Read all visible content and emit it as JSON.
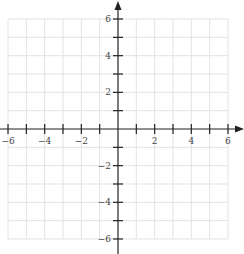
{
  "chart_data": {
    "type": "scatter",
    "title": "",
    "xlabel": "",
    "ylabel": "",
    "xlim": [
      -6,
      6
    ],
    "ylim": [
      -6,
      6
    ],
    "grid": true,
    "x_ticks": [
      -6,
      -5,
      -4,
      -3,
      -2,
      -1,
      1,
      2,
      3,
      4,
      5,
      6
    ],
    "x_tick_labels": [
      "-6",
      "-4",
      "-2",
      "2",
      "4",
      "6"
    ],
    "y_ticks": [
      -6,
      -5,
      -4,
      -3,
      -2,
      -1,
      1,
      2,
      3,
      4,
      5,
      6
    ],
    "y_tick_labels": [
      "6",
      "4",
      "2",
      "-2",
      "-4",
      "-6"
    ],
    "series": [],
    "legend": null
  },
  "colors": {
    "grid": "#e3e3e3",
    "axis": "#222222",
    "label": "#444444"
  }
}
